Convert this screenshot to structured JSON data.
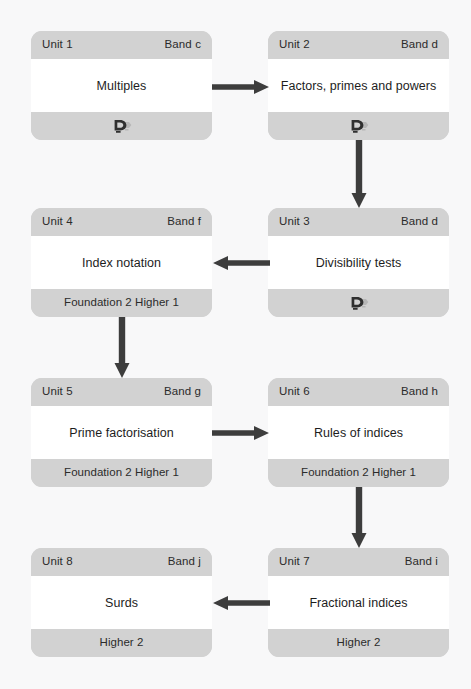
{
  "diagram": {
    "background_color": "#f8f8f9",
    "card_band_color": "#d2d2d2",
    "card_body_color": "#ffffff",
    "arrow_color": "#3d3d3d"
  },
  "labels": {
    "unit_prefix": "Unit",
    "band_prefix": "Band"
  },
  "units": [
    {
      "id": "unit-1",
      "unit": "Unit 1",
      "band": "Band c",
      "topic": "Multiples",
      "footer_kind": "logo",
      "footer_text": "",
      "icon": "brand-d-icon"
    },
    {
      "id": "unit-2",
      "unit": "Unit 2",
      "band": "Band d",
      "topic": "Factors, primes and powers",
      "footer_kind": "logo",
      "footer_text": "",
      "icon": "brand-d-icon"
    },
    {
      "id": "unit-4",
      "unit": "Unit 4",
      "band": "Band f",
      "topic": "Index notation",
      "footer_kind": "text",
      "footer_text": "Foundation 2 Higher 1",
      "icon": ""
    },
    {
      "id": "unit-3",
      "unit": "Unit 3",
      "band": "Band d",
      "topic": "Divisibility tests",
      "footer_kind": "logo",
      "footer_text": "",
      "icon": "brand-d-icon"
    },
    {
      "id": "unit-5",
      "unit": "Unit 5",
      "band": "Band g",
      "topic": "Prime factorisation",
      "footer_kind": "text",
      "footer_text": "Foundation 2 Higher 1",
      "icon": ""
    },
    {
      "id": "unit-6",
      "unit": "Unit 6",
      "band": "Band h",
      "topic": "Rules of indices",
      "footer_kind": "text",
      "footer_text": "Foundation 2 Higher 1",
      "icon": ""
    },
    {
      "id": "unit-8",
      "unit": "Unit 8",
      "band": "Band j",
      "topic": "Surds",
      "footer_kind": "text",
      "footer_text": "Higher 2",
      "icon": ""
    },
    {
      "id": "unit-7",
      "unit": "Unit 7",
      "band": "Band i",
      "topic": "Fractional indices",
      "footer_kind": "text",
      "footer_text": "Higher 2",
      "icon": ""
    }
  ],
  "connectors": [
    {
      "id": "arrow-unit1-to-unit2",
      "from": "Unit 1",
      "to": "Unit 2",
      "direction": "right"
    },
    {
      "id": "arrow-unit2-to-unit3",
      "from": "Unit 2",
      "to": "Unit 3",
      "direction": "down"
    },
    {
      "id": "arrow-unit3-to-unit4",
      "from": "Unit 3",
      "to": "Unit 4",
      "direction": "left"
    },
    {
      "id": "arrow-unit4-to-unit5",
      "from": "Unit 4",
      "to": "Unit 5",
      "direction": "down"
    },
    {
      "id": "arrow-unit5-to-unit6",
      "from": "Unit 5",
      "to": "Unit 6",
      "direction": "right"
    },
    {
      "id": "arrow-unit6-to-unit7",
      "from": "Unit 6",
      "to": "Unit 7",
      "direction": "down"
    },
    {
      "id": "arrow-unit7-to-unit8",
      "from": "Unit 7",
      "to": "Unit 8",
      "direction": "left"
    }
  ]
}
